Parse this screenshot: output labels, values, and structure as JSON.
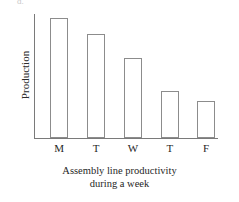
{
  "figure": {
    "item_letter": "d.",
    "caption_line1": "Assembly line productivity",
    "caption_line2": "during a week",
    "axis_color": "#7a7a7a",
    "bar_stroke_color": "#8c8c8c",
    "bar_fill_color": "#ffffff",
    "background_color": "#ffffff"
  },
  "chart_data": {
    "type": "bar",
    "title": "Assembly line productivity during a week",
    "subtitle": "during a week",
    "xlabel": "",
    "ylabel": "Production",
    "categories": [
      "M",
      "T",
      "W",
      "T",
      "F"
    ],
    "category_names": [
      "Monday",
      "Tuesday",
      "Wednesday",
      "Thursday",
      "Friday"
    ],
    "values": [
      120,
      104,
      80,
      47,
      37
    ],
    "values_unit": "relative units (unlabeled axis)",
    "ylim": [
      0,
      124
    ],
    "xlim": [
      0,
      5
    ],
    "grid": false,
    "legend": false,
    "legend_position": "none",
    "y_tick_labels": [],
    "x_tick_labels": [
      "M",
      "T",
      "W",
      "T",
      "F"
    ],
    "bars": [
      {
        "label": "M",
        "value": 120,
        "x_center_pct": 13.6,
        "width_pct": 9.8
      },
      {
        "label": "T",
        "value": 104,
        "x_center_pct": 33.7,
        "width_pct": 9.8
      },
      {
        "label": "W",
        "value": 80,
        "x_center_pct": 53.8,
        "width_pct": 10.3
      },
      {
        "label": "T",
        "value": 47,
        "x_center_pct": 73.9,
        "width_pct": 9.8
      },
      {
        "label": "F",
        "value": 37,
        "x_center_pct": 93.5,
        "width_pct": 9.8
      }
    ],
    "annotations": []
  }
}
